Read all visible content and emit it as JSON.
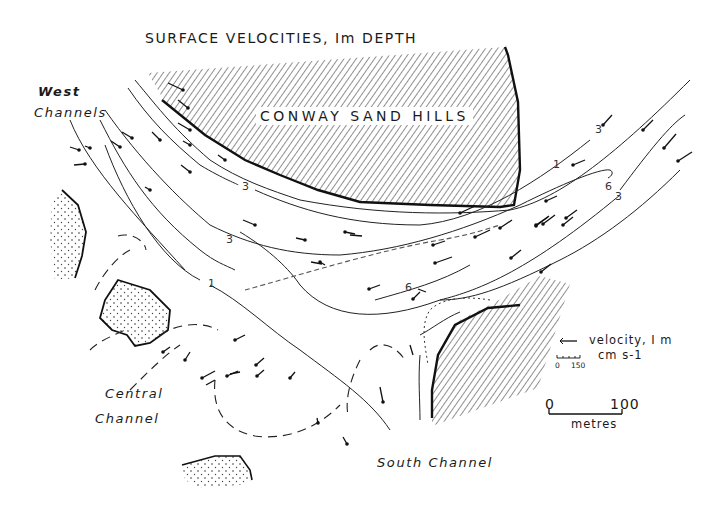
{
  "figure": {
    "title": "SURFACE VELOCITIES, Im DEPTH",
    "colors": {
      "ink": "#1a1a1a",
      "background": "#ffffff",
      "hatch": "#333333"
    }
  },
  "places": {
    "sand_hills": "CONWAY  SAND  HILLS",
    "west_channels_line1": "West",
    "west_channels_line2": "Channels",
    "central_channel_line1": "Central",
    "central_channel_line2": "Channel",
    "south_channel": "South Channel"
  },
  "contour_labels": [
    {
      "value": "3",
      "x": 242,
      "y": 181
    },
    {
      "value": "3",
      "x": 226,
      "y": 234
    },
    {
      "value": "1",
      "x": 208,
      "y": 278
    },
    {
      "value": "1",
      "x": 553,
      "y": 159
    },
    {
      "value": "3",
      "x": 595,
      "y": 124
    },
    {
      "value": "6",
      "x": 605,
      "y": 181
    },
    {
      "value": "3",
      "x": 615,
      "y": 191
    },
    {
      "value": "6",
      "x": 405,
      "y": 282
    }
  ],
  "legend": {
    "velocity_label": "velocity, I m",
    "velocity_units": "cm s-1",
    "velocity_scale_min": "0",
    "velocity_scale_max": "150",
    "distance_min": "0",
    "distance_max": "100",
    "distance_units": "metres"
  }
}
